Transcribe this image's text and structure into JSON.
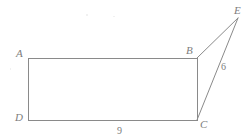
{
  "figure": {
    "type": "geometry-diagram",
    "canvas": {
      "width": 251,
      "height": 140
    },
    "stroke_color": "#8a8a8a",
    "label_color": "#7d7d7d",
    "background_color": "#ffffff",
    "points": {
      "A": {
        "label": "A",
        "x": 28,
        "y": 58
      },
      "B": {
        "label": "B",
        "x": 197,
        "y": 58
      },
      "C": {
        "label": "C",
        "x": 197,
        "y": 120
      },
      "D": {
        "label": "D",
        "x": 28,
        "y": 120
      },
      "E": {
        "label": "E",
        "x": 238,
        "y": 18
      }
    },
    "segments": [
      {
        "name": "AB",
        "from": "A",
        "to": "B"
      },
      {
        "name": "BC",
        "from": "B",
        "to": "C"
      },
      {
        "name": "CD",
        "from": "C",
        "to": "D"
      },
      {
        "name": "DA",
        "from": "D",
        "to": "A"
      },
      {
        "name": "BE",
        "from": "B",
        "to": "E"
      },
      {
        "name": "CE",
        "from": "C",
        "to": "E"
      }
    ],
    "measurements": [
      {
        "name": "DC",
        "value": "9",
        "x": 117,
        "y": 126
      },
      {
        "name": "CE",
        "value": "6",
        "x": 221,
        "y": 62
      }
    ],
    "label_positions": {
      "A": {
        "x": 16,
        "y": 48
      },
      "B": {
        "x": 186,
        "y": 45
      },
      "C": {
        "x": 200,
        "y": 119
      },
      "D": {
        "x": 15,
        "y": 112
      },
      "E": {
        "x": 234,
        "y": 5
      }
    }
  }
}
